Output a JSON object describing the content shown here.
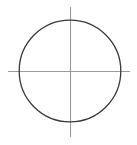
{
  "figure": {
    "title": "Circle with crosshair axes",
    "canvas": {
      "width": 137,
      "height": 145,
      "background_color": "#ffffff"
    }
  },
  "chart_data": {
    "type": "diagram",
    "title": "Circle with crosshair axes",
    "subtitle": "",
    "xlabel": "",
    "ylabel": "",
    "grid": false,
    "legend": null,
    "legend_position": "none",
    "annotations": [],
    "tick_labels": [],
    "axis_ranges": {
      "x": [
        0,
        137
      ],
      "y": [
        0,
        145
      ]
    },
    "shapes": [
      {
        "name": "circle",
        "kind": "circle",
        "center_x": 70,
        "center_y": 71,
        "radius": 50.8,
        "stroke_color": "#3a3a3a",
        "stroke_width": 1.3,
        "fill": "none",
        "bbox": {
          "left": 19.2,
          "top": 20.2,
          "right": 120.8,
          "bottom": 121.8
        }
      },
      {
        "name": "vertical-axis",
        "kind": "line",
        "x1": 70.5,
        "y1": 7,
        "x2": 70.5,
        "y2": 137,
        "stroke_color": "#9a9a9a",
        "stroke_width": 1.1,
        "length": 130
      },
      {
        "name": "horizontal-axis",
        "kind": "line",
        "x1": 8,
        "y1": 71.5,
        "x2": 130,
        "y2": 71.5,
        "stroke_color": "#9a9a9a",
        "stroke_width": 1.1,
        "length": 122
      }
    ],
    "intersection_point": {
      "x": 70.5,
      "y": 71.5
    }
  }
}
